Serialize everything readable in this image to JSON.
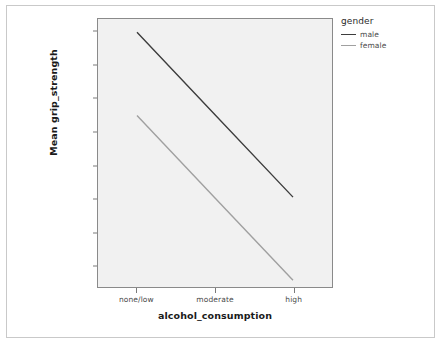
{
  "chart_data": {
    "type": "line",
    "title": "",
    "xlabel": "alcohol_consumption",
    "ylabel": "Mean grip_strength",
    "categories": [
      "none/low",
      "moderate",
      "high"
    ],
    "series": [
      {
        "name": "male",
        "values": [
          20.0,
          15.05,
          10.1
        ],
        "color": "#3d3d3d"
      },
      {
        "name": "female",
        "values": [
          15.0,
          10.05,
          5.1
        ],
        "color": "#a0a0a0"
      }
    ],
    "yticks": [
      "20.00",
      "18.00",
      "16.00",
      "14.00",
      "12.00",
      "10.00",
      "8.00",
      "6.00"
    ],
    "ytick_values": [
      20,
      18,
      16,
      14,
      12,
      10,
      8,
      6
    ],
    "ylim": [
      4.7,
      20.8
    ],
    "xlim": [
      0,
      3
    ],
    "grid": false,
    "legend": {
      "title": "gender",
      "position": "right",
      "entries": [
        "male",
        "female"
      ]
    },
    "panel_background": "#f1f1f1",
    "panel_border": "#8a8a8a"
  },
  "legend": {
    "title": "gender",
    "entries": [
      {
        "label": "male",
        "color": "#3d3d3d"
      },
      {
        "label": "female",
        "color": "#a0a0a0"
      }
    ]
  },
  "axes": {
    "y_title": "Mean grip_strength",
    "x_title": "alcohol_consumption",
    "y_tick_labels": [
      "20.00",
      "18.00",
      "16.00",
      "14.00",
      "12.00",
      "10.00",
      "8.00",
      "6.00"
    ],
    "x_tick_labels": [
      "none/low",
      "moderate",
      "high"
    ]
  }
}
